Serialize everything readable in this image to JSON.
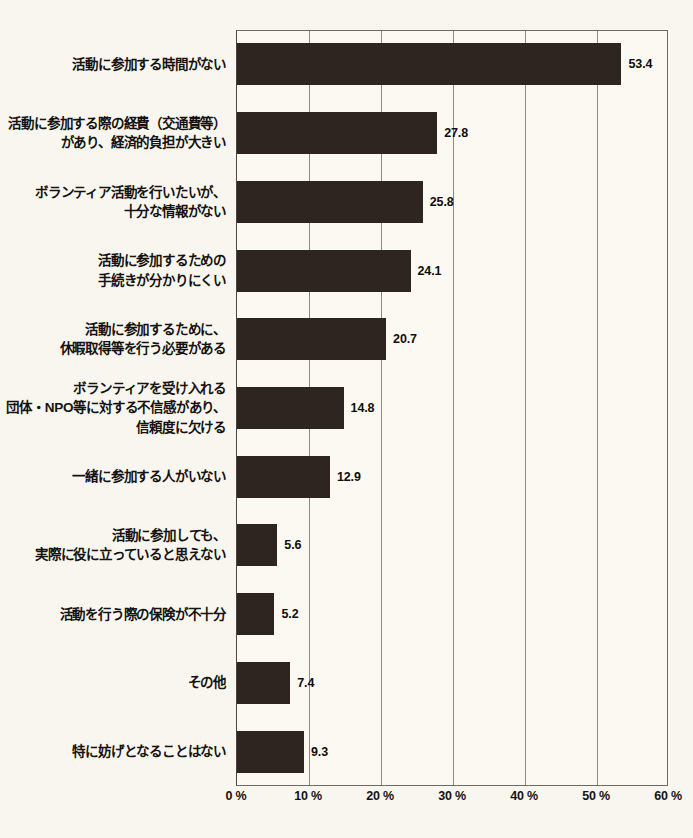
{
  "chart_data": {
    "type": "bar",
    "orientation": "horizontal",
    "title": "",
    "xlabel": "",
    "ylabel": "",
    "xlim": [
      0,
      60
    ],
    "grid": true,
    "legend": null,
    "xticks": [
      "0 %",
      "10 %",
      "20 %",
      "30 %",
      "40 %",
      "50 %",
      "60 %"
    ],
    "xtick_values": [
      0,
      10,
      20,
      30,
      40,
      50,
      60
    ],
    "categories": [
      "活動に参加する時間がない",
      "活動に参加する際の経費（交通費等）\nがあり、経済的負担が大きい",
      "ボランティア活動を行いたいが、\n十分な情報がない",
      "活動に参加するための\n手続きが分かりにくい",
      "活動に参加するために、\n休暇取得等を行う必要がある",
      "ボランティアを受け入れる\n団体・NPO等に対する不信感があり、\n信頼度に欠ける",
      "一緒に参加する人がいない",
      "活動に参加しても、\n実際に役に立っていると思えない",
      "活動を行う際の保険が不十分",
      "その他",
      "特に妨げとなることはない"
    ],
    "values": [
      53.4,
      27.8,
      25.8,
      24.1,
      20.7,
      14.8,
      12.9,
      5.6,
      5.2,
      7.4,
      9.3
    ],
    "value_labels": [
      "53.4",
      "27.8",
      "25.8",
      "24.1",
      "20.7",
      "14.8",
      "12.9",
      "5.6",
      "5.2",
      "7.4",
      "9.3"
    ],
    "bar_color": "#2e2520",
    "background_color": "#f8f6ef",
    "axis_color": "#6e6a62"
  },
  "caption": {
    "text": ""
  }
}
